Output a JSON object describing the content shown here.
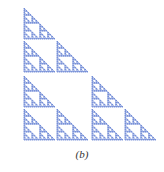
{
  "figure": {
    "type": "sierpinski-right-triangle",
    "caption": "(b)",
    "color": "#6f8ad6",
    "origin": [
      24,
      8
    ],
    "size": 132,
    "gap": 4,
    "depth": 6
  }
}
